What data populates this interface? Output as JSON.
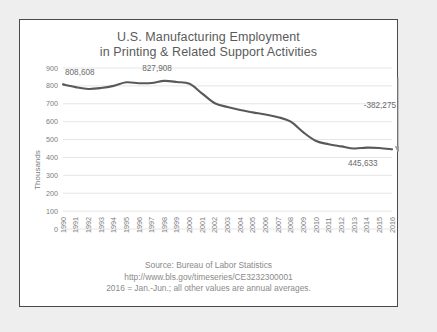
{
  "chart_data": {
    "type": "line",
    "title": "U.S. Manufacturing Employment",
    "subtitle": "in Printing & Related Support Activities",
    "xlabel": "",
    "ylabel": "Thousands",
    "ylim": [
      0,
      900
    ],
    "ytick_step": 100,
    "yticks": [
      "900",
      "800",
      "700",
      "600",
      "500",
      "400",
      "300",
      "200",
      "100",
      "0"
    ],
    "grid": true,
    "legend": "none",
    "line_color": "#595959",
    "categories": [
      "1990",
      "1991",
      "1992",
      "1993",
      "1994",
      "1995",
      "1996",
      "1997",
      "1998",
      "1999",
      "2000",
      "2001",
      "2002",
      "2003",
      "2004",
      "2005",
      "2006",
      "2007",
      "2008",
      "2009",
      "2010",
      "2011",
      "2012",
      "2013",
      "2014",
      "2015",
      "2016"
    ],
    "values": [
      808.608,
      793,
      783,
      788,
      800,
      820,
      815,
      816,
      827.908,
      822,
      812,
      757,
      703,
      682,
      665,
      652,
      640,
      625,
      600,
      540,
      492,
      474,
      462,
      450,
      455,
      453,
      445.633
    ],
    "annotations": [
      {
        "name": "start-value",
        "text": "808,608",
        "x": "1990",
        "value": 808.608
      },
      {
        "name": "peak-value",
        "text": "827,908",
        "x": "1998",
        "value": 827.908
      },
      {
        "name": "end-value",
        "text": "445,633",
        "x": "2016",
        "value": 445.633
      },
      {
        "name": "change-value",
        "text": "-382,275",
        "from": 808.608,
        "to": 445.633
      }
    ]
  },
  "footer": {
    "line1": "Source: Bureau of Labor Statistics",
    "line2": "http://www.bls.gov/timeseries/CE3232300001",
    "line3": "2016 = Jan.-Jun.; all other values are annual averages."
  }
}
